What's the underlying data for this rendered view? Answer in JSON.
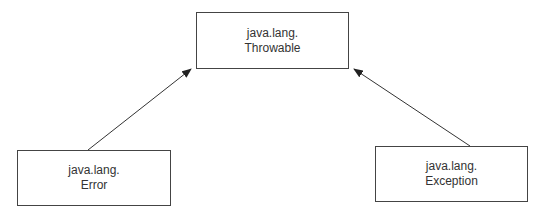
{
  "diagram": {
    "type": "class-hierarchy",
    "nodes": [
      {
        "id": "throwable",
        "line1": "java.lang.",
        "line2": "Throwable"
      },
      {
        "id": "error",
        "line1": "java.lang.",
        "line2": "Error"
      },
      {
        "id": "exception",
        "line1": "java.lang.",
        "line2": "Exception"
      }
    ],
    "edges": [
      {
        "from": "error",
        "to": "throwable"
      },
      {
        "from": "exception",
        "to": "throwable"
      }
    ],
    "colors": {
      "stroke": "#444444",
      "text": "#333333",
      "background": "#ffffff"
    }
  }
}
